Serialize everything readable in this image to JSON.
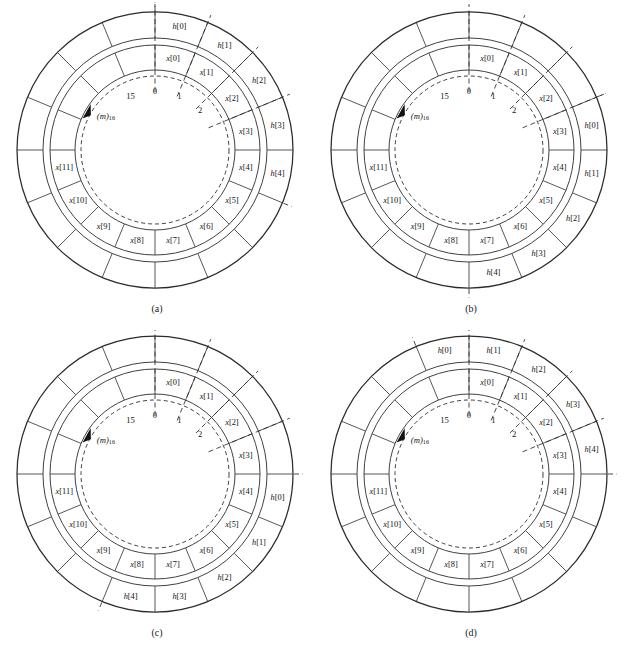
{
  "figure": {
    "type": "ring-buffer-diagram",
    "colors": {
      "background": "#ffffff",
      "line": "#2b2b2b",
      "cell_divider": "#3a3a3a",
      "text": "#121212"
    },
    "geometry": {
      "cells_per_ring": 16,
      "outer_ring_outer_radius": 138,
      "outer_ring_inner_radius": 112,
      "inner_ring_outer_radius": 105,
      "inner_ring_inner_radius": 80,
      "dashed_circle_radius": 74,
      "center_x": 155,
      "center_y": 150
    },
    "index_ticks": {
      "labels": [
        "2",
        "1",
        "0",
        "15"
      ],
      "radius": 64,
      "cell_indices": [
        2,
        1,
        0,
        15
      ]
    },
    "pointer": {
      "label_main": "(m)",
      "label_sub": "16",
      "direction": "counterclockwise"
    },
    "inner_ring_labels": [
      {
        "index": 0,
        "text": "x[0]"
      },
      {
        "index": 1,
        "text": "x[1]"
      },
      {
        "index": 2,
        "text": "x[2]"
      },
      {
        "index": 3,
        "text": "x[3]"
      },
      {
        "index": 4,
        "text": "x[4]"
      },
      {
        "index": 5,
        "text": "x[5]"
      },
      {
        "index": 6,
        "text": "x[6]"
      },
      {
        "index": 7,
        "text": "x[7]"
      },
      {
        "index": 8,
        "text": "x[8]"
      },
      {
        "index": 9,
        "text": "x[9]"
      },
      {
        "index": 10,
        "text": "x[10]"
      },
      {
        "index": 11,
        "text": "x[11]"
      }
    ],
    "outer_ring_labels": [
      "h[0]",
      "h[1]",
      "h[2]",
      "h[3]",
      "h[4]"
    ],
    "dashed_ray_cells": [
      0,
      1,
      2,
      3
    ],
    "panels": [
      {
        "id": "a",
        "caption": "(a)",
        "h_start_cell": 0,
        "h_labels": [
          "h[0]",
          "h[1]",
          "h[2]",
          "h[3]",
          "h[4]"
        ]
      },
      {
        "id": "b",
        "caption": "(b)",
        "h_start_cell": 3,
        "h_labels": [
          "h[0]",
          "h[1]",
          "h[2]",
          "h[3]",
          "h[4]"
        ]
      },
      {
        "id": "c",
        "caption": "(c)",
        "h_start_cell": 4,
        "h_labels": [
          "h[0]",
          "h[1]",
          "h[2]",
          "h[3]",
          "h[4]"
        ]
      },
      {
        "id": "d",
        "caption": "(d)",
        "h_start_cell": 15,
        "h_labels": [
          "h[0]",
          "h[1]",
          "h[2]",
          "h[3]",
          "h[4]"
        ]
      }
    ]
  }
}
